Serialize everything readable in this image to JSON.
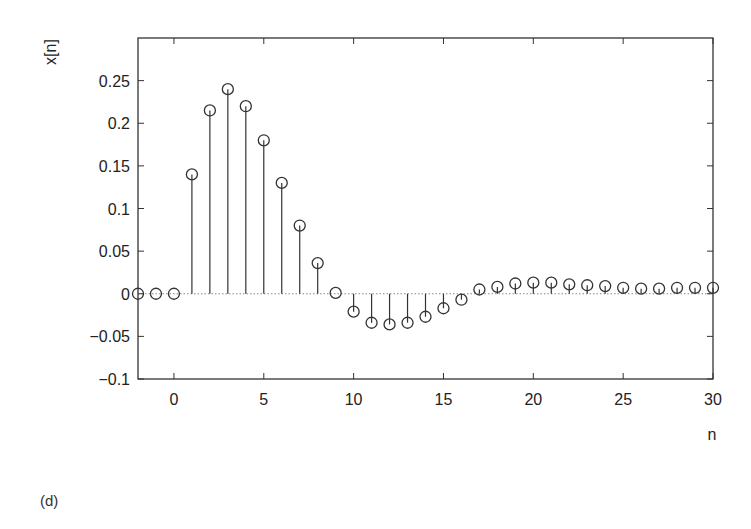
{
  "figure": {
    "caption": "(d)"
  },
  "chart_data": {
    "type": "stem",
    "title": "",
    "xlabel": "n",
    "ylabel": "x[n]",
    "xlim": [
      -2,
      30
    ],
    "ylim": [
      -0.1,
      0.3
    ],
    "xticks": [
      0,
      5,
      10,
      15,
      20,
      25,
      30
    ],
    "xtick_labels": [
      "0",
      "5",
      "10",
      "15",
      "20",
      "25",
      "30"
    ],
    "yticks": [
      -0.1,
      -0.05,
      0,
      0.05,
      0.1,
      0.15,
      0.2,
      0.25
    ],
    "ytick_labels": [
      "−0.1",
      "−0.05",
      "0",
      "0.05",
      "0.1",
      "0.15",
      "0.2",
      "0.25"
    ],
    "grid": false,
    "zero_line": "dotted",
    "marker": "open-circle",
    "line_color": "#333333",
    "x": [
      -2,
      -1,
      0,
      1,
      2,
      3,
      4,
      5,
      6,
      7,
      8,
      9,
      10,
      11,
      12,
      13,
      14,
      15,
      16,
      17,
      18,
      19,
      20,
      21,
      22,
      23,
      24,
      25,
      26,
      27,
      28,
      29,
      30
    ],
    "values": [
      0,
      0,
      0,
      0.14,
      0.215,
      0.24,
      0.22,
      0.18,
      0.13,
      0.08,
      0.036,
      0.001,
      -0.021,
      -0.034,
      -0.036,
      -0.034,
      -0.027,
      -0.017,
      -0.007,
      0.005,
      0.008,
      0.012,
      0.013,
      0.013,
      0.011,
      0.01,
      0.009,
      0.007,
      0.006,
      0.006,
      0.007,
      0.007,
      0.007
    ]
  }
}
